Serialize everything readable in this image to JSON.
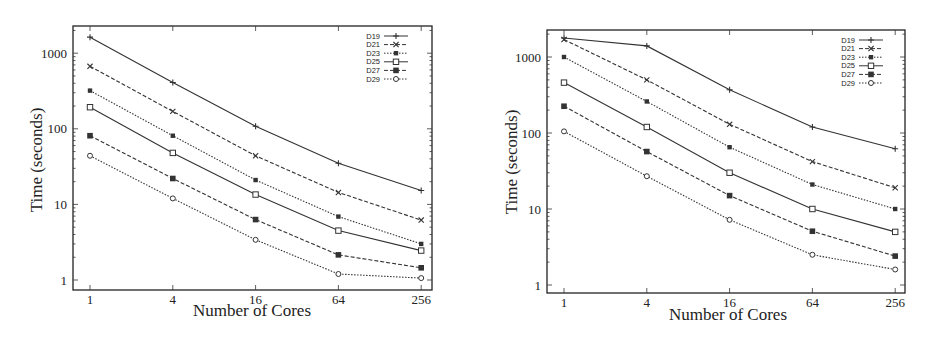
{
  "chart_data": [
    {
      "type": "line",
      "title": "",
      "xlabel": "Number of Cores",
      "ylabel": "Time (seconds)",
      "x": [
        1,
        4,
        16,
        64,
        256
      ],
      "x_tick_labels": [
        "1",
        "4",
        "16",
        "64",
        "256"
      ],
      "y_tick_labels": [
        "1",
        "10",
        "100",
        "1000"
      ],
      "yscale": "log",
      "xscale": "log2",
      "ylim": [
        0.8,
        2200
      ],
      "grid": false,
      "legend_position": "top-right",
      "series": [
        {
          "name": "D19",
          "marker": "plus",
          "dash": "solid",
          "values": [
            1630,
            410,
            108,
            35,
            15.3
          ]
        },
        {
          "name": "D21",
          "marker": "x",
          "dash": "dashed",
          "values": [
            670,
            170,
            44,
            14.4,
            6.2
          ]
        },
        {
          "name": "D23",
          "marker": "filled-square-small",
          "dash": "dotted",
          "values": [
            320,
            81,
            21,
            6.9,
            3.0
          ]
        },
        {
          "name": "D25",
          "marker": "open-square",
          "dash": "solid",
          "values": [
            193,
            48,
            13.5,
            4.5,
            2.45
          ]
        },
        {
          "name": "D27",
          "marker": "filled-square",
          "dash": "dashed",
          "values": [
            81,
            22,
            6.3,
            2.15,
            1.45
          ]
        },
        {
          "name": "D29",
          "marker": "open-circle",
          "dash": "dotted",
          "values": [
            44,
            12,
            3.4,
            1.2,
            1.06
          ]
        }
      ]
    },
    {
      "type": "line",
      "title": "",
      "xlabel": "Number of Cores",
      "ylabel": "Time (seconds)",
      "x": [
        1,
        4,
        16,
        64,
        256
      ],
      "x_tick_labels": [
        "1",
        "4",
        "16",
        "64",
        "256"
      ],
      "y_tick_labels": [
        "1",
        "10",
        "100",
        "1000"
      ],
      "yscale": "log",
      "xscale": "log2",
      "ylim": [
        0.8,
        2200
      ],
      "grid": false,
      "legend_position": "top-right",
      "series": [
        {
          "name": "D19",
          "marker": "plus",
          "dash": "solid",
          "values": [
            1780,
            1400,
            370,
            120,
            62
          ]
        },
        {
          "name": "D21",
          "marker": "x",
          "dash": "dashed",
          "values": [
            1700,
            500,
            130,
            42,
            19
          ]
        },
        {
          "name": "D23",
          "marker": "filled-square-small",
          "dash": "dotted",
          "values": [
            1000,
            260,
            65,
            21,
            10
          ]
        },
        {
          "name": "D25",
          "marker": "open-square",
          "dash": "solid",
          "values": [
            460,
            120,
            30,
            10,
            5
          ]
        },
        {
          "name": "D27",
          "marker": "filled-square",
          "dash": "dashed",
          "values": [
            225,
            57,
            15,
            5.1,
            2.4
          ]
        },
        {
          "name": "D29",
          "marker": "open-circle",
          "dash": "dotted",
          "values": [
            105,
            27,
            7.2,
            2.5,
            1.6
          ]
        }
      ]
    }
  ],
  "layout": [
    {
      "frame": {
        "left": 73,
        "top": 26,
        "right": 432,
        "bottom": 290
      },
      "x1": 90,
      "xstep": 82.8,
      "y1": 280,
      "decade": 75.6,
      "ylabel_x": 42,
      "ylabel_y": 160,
      "xlabel_x": 252,
      "xlabel_y": 316,
      "legend_x": 380,
      "legend_y": 36
    },
    {
      "frame": {
        "left": 547,
        "top": 30,
        "right": 905,
        "bottom": 293
      },
      "x1": 564,
      "xstep": 82.8,
      "y1": 285,
      "decade": 76,
      "ylabel_x": 517,
      "ylabel_y": 162,
      "xlabel_x": 728,
      "xlabel_y": 320,
      "legend_x": 855,
      "legend_y": 40
    }
  ],
  "style": {
    "line_color": "#333333",
    "frame_color": "#222222",
    "background": "#ffffff"
  }
}
